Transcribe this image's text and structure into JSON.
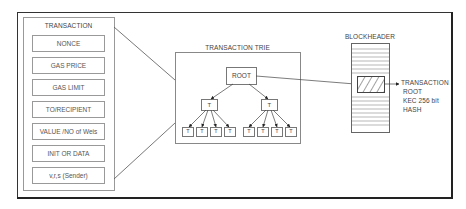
{
  "transaction": {
    "title": "TRANSACTION",
    "fields": [
      {
        "label": "NONCE"
      },
      {
        "label": "GAS PRICE"
      },
      {
        "label": "GAS LIMIT"
      },
      {
        "label": "TO/RECIPIENT"
      },
      {
        "label": "VALUE /NO of Weis"
      },
      {
        "label": "INIT OR DATA"
      },
      {
        "label": "v,r,s (Sender)"
      }
    ]
  },
  "trie": {
    "title": "TRANSACTION TRIE",
    "root_label": "ROOT",
    "branch_label": "T",
    "leaf_label": "T"
  },
  "blockheader": {
    "title": "BLOCKHEADER",
    "annotation": [
      "TRANSACTION",
      "ROOT",
      "KEC 256 bit",
      "HASH"
    ]
  }
}
